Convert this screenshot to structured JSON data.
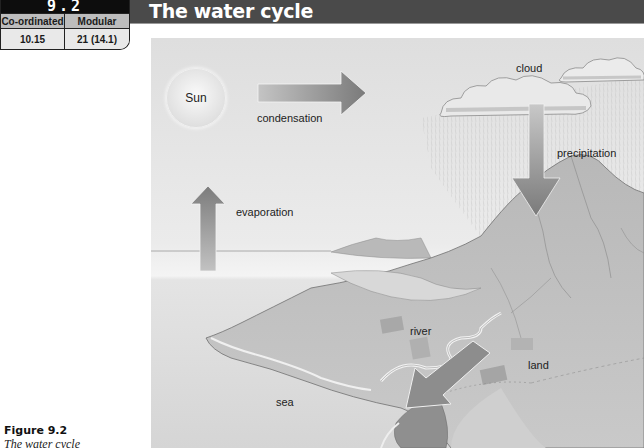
{
  "section": {
    "number": "9.2",
    "table": {
      "headers": [
        "Co-ordinated",
        "Modular"
      ],
      "values": [
        "10.15",
        "21 (14.1)"
      ]
    }
  },
  "page_title": "The water cycle",
  "figure": {
    "label": "Figure 9.2",
    "title": "The water cycle",
    "labels": {
      "sun": "Sun",
      "condensation": "condensation",
      "cloud": "cloud",
      "precipitation": "precipitation",
      "evaporation": "evaporation",
      "river": "river",
      "land": "land",
      "sea": "sea"
    },
    "arrows": [
      "condensation-arrow",
      "precipitation-arrow",
      "evaporation-arrow",
      "runoff-arrow"
    ]
  }
}
